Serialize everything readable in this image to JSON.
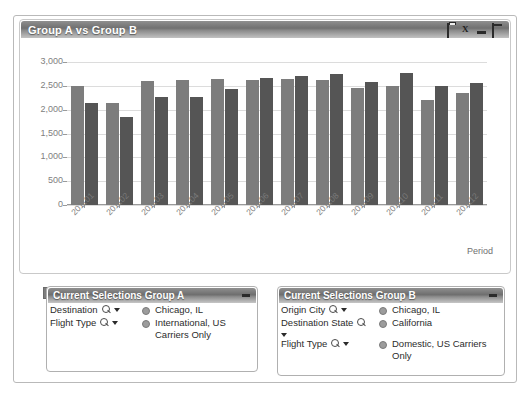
{
  "window": {
    "title": "Group A vs Group B",
    "icons": [
      {
        "name": "print-icon",
        "label": ""
      },
      {
        "name": "excel-export-icon",
        "label": "X"
      },
      {
        "name": "minimize-icon",
        "label": ""
      },
      {
        "name": "maximize-icon",
        "label": ""
      }
    ]
  },
  "chart_data": {
    "type": "bar",
    "title": "Group A vs Group B",
    "xlabel": "Period",
    "ylabel": "",
    "ylim": [
      0,
      3000
    ],
    "ytick_labels": [
      "3,000",
      "2,500",
      "2,000",
      "1,500",
      "1,000",
      "500",
      "0"
    ],
    "yticks": [
      3000,
      2500,
      2000,
      1500,
      1000,
      500,
      0
    ],
    "grid": true,
    "legend_position": "bottom-left",
    "categories": [
      "201101",
      "201102",
      "201103",
      "201104",
      "201105",
      "201106",
      "201107",
      "201108",
      "201109",
      "201110",
      "201111",
      "201112"
    ],
    "series": [
      {
        "name": "Group A Flights",
        "color": "#7d7d7d",
        "values": [
          2500,
          2150,
          2600,
          2625,
          2650,
          2625,
          2650,
          2625,
          2450,
          2500,
          2200,
          2350
        ]
      },
      {
        "name": "Group B Flights",
        "color": "#555555",
        "values": [
          2150,
          1850,
          2275,
          2275,
          2425,
          2675,
          2700,
          2750,
          2575,
          2775,
          2500,
          2550
        ]
      }
    ]
  },
  "legend": [
    {
      "label": "Group A Flights",
      "swatch": "a"
    },
    {
      "label": "Group B Flights",
      "swatch": "b"
    }
  ],
  "panels": [
    {
      "title": "Current Selections Group A",
      "rows": [
        {
          "field": "Destination",
          "value": "Chicago, IL"
        },
        {
          "field": "Flight Type",
          "value": "International, US Carriers Only"
        }
      ]
    },
    {
      "title": "Current Selections Group B",
      "rows": [
        {
          "field": "Origin City",
          "value": "Chicago, IL"
        },
        {
          "field": "Destination State",
          "value": "California"
        },
        {
          "field": "Flight Type",
          "value": "Domestic, US Carriers Only"
        }
      ]
    }
  ]
}
